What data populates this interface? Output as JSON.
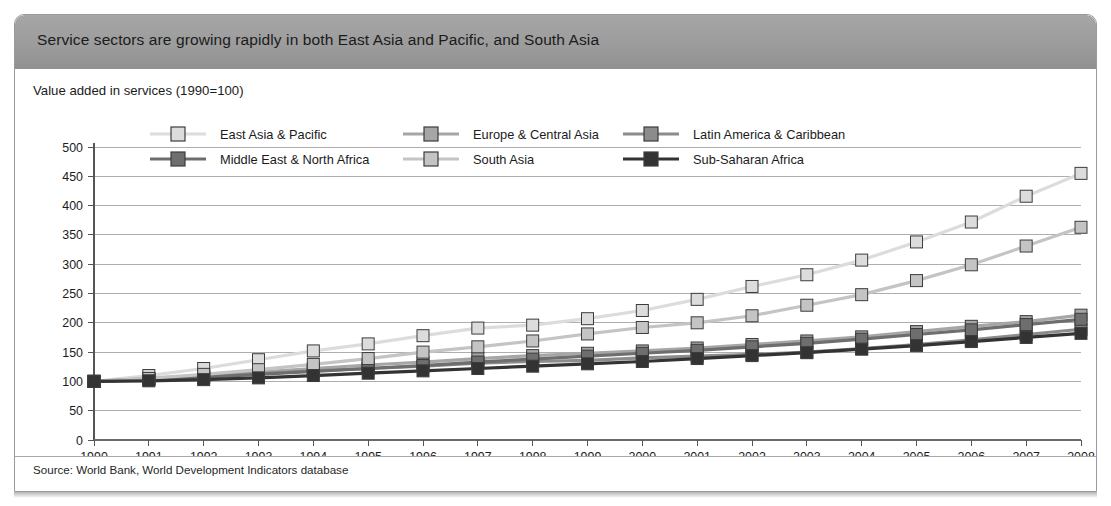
{
  "header": {
    "title": "Service sectors are growing rapidly in both East Asia and Pacific, and South Asia"
  },
  "subtitle": "Value added in services (1990=100)",
  "source": "Source: World Bank, World Development Indicators database",
  "colors": {
    "header_bar": "#9c9c9c",
    "frame_border": "#9a9a9a",
    "grid": "#9a9a9a",
    "axis": "#555555",
    "text": "#1b1b1b",
    "east_asia_pacific": "#dcdcdc",
    "europe_central_asia": "#a6a6a6",
    "latin_america_caribbean": "#8c8c8c",
    "middle_east_north_africa": "#6e6e6e",
    "south_asia": "#c4c4c4",
    "sub_saharan_africa": "#333333"
  },
  "chart_data": {
    "type": "line",
    "title": "Value added in services (1990=100)",
    "xlabel": "",
    "ylabel": "",
    "xlim": [
      1990,
      2008
    ],
    "ylim": [
      0,
      500
    ],
    "ytick_step": 50,
    "grid": true,
    "legend_position": "top-inside",
    "yticks": [
      0,
      50,
      100,
      150,
      200,
      250,
      300,
      350,
      400,
      450,
      500
    ],
    "x": [
      1990,
      1991,
      1992,
      1993,
      1994,
      1995,
      1996,
      1997,
      1998,
      1999,
      2000,
      2001,
      2002,
      2003,
      2004,
      2005,
      2006,
      2007,
      2008
    ],
    "categories": [
      "1990",
      "1991",
      "1992",
      "1993",
      "1994",
      "1995",
      "1996",
      "1997",
      "1998",
      "1999",
      "2000",
      "2001",
      "2002",
      "2003",
      "2004",
      "2005",
      "2006",
      "2007",
      "2008"
    ],
    "series": [
      {
        "name": "East Asia & Pacific",
        "color": "#dcdcdc",
        "values": [
          100,
          110,
          122,
          137,
          152,
          164,
          178,
          191,
          196,
          207,
          221,
          240,
          262,
          282,
          307,
          338,
          372,
          416,
          455
        ]
      },
      {
        "name": "Europe & Central Asia",
        "color": "#a6a6a6",
        "values": [
          100,
          105,
          110,
          116,
          122,
          128,
          133,
          139,
          144,
          148,
          152,
          157,
          163,
          169,
          176,
          185,
          194,
          202,
          213
        ]
      },
      {
        "name": "Latin America & Caribbean",
        "color": "#8c8c8c",
        "values": [
          100,
          104,
          108,
          113,
          118,
          122,
          126,
          131,
          134,
          136,
          140,
          143,
          146,
          150,
          156,
          163,
          171,
          180,
          189
        ]
      },
      {
        "name": "Middle East & North Africa",
        "color": "#6e6e6e",
        "values": [
          100,
          103,
          107,
          112,
          117,
          122,
          127,
          133,
          138,
          143,
          148,
          153,
          159,
          165,
          172,
          180,
          188,
          197,
          206
        ]
      },
      {
        "name": "South Asia",
        "color": "#c4c4c4",
        "values": [
          100,
          105,
          112,
          120,
          129,
          139,
          150,
          159,
          169,
          181,
          192,
          200,
          212,
          230,
          248,
          272,
          299,
          331,
          363
        ]
      },
      {
        "name": "Sub-Saharan Africa",
        "color": "#333333",
        "values": [
          100,
          101,
          103,
          106,
          110,
          114,
          118,
          122,
          126,
          130,
          134,
          139,
          144,
          149,
          155,
          161,
          168,
          175,
          182
        ]
      }
    ]
  }
}
